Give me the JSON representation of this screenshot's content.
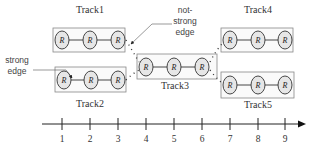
{
  "diagram": {
    "tracks": [
      {
        "label": "Track1",
        "nodes": [
          "R",
          "R",
          "R"
        ],
        "box": [
          53,
          28,
          72,
          24
        ],
        "label_pos": [
          90,
          13
        ],
        "node_y": 40,
        "node_x": [
          62,
          90,
          118
        ]
      },
      {
        "label": "Track2",
        "nodes": [
          "R",
          "R",
          "R"
        ],
        "box": [
          55,
          67,
          71,
          25
        ],
        "label_pos": [
          90,
          107
        ],
        "node_y": 80,
        "node_x": [
          64,
          91,
          118
        ]
      },
      {
        "label": "Track3",
        "nodes": [
          "R",
          "R",
          "R"
        ],
        "box": [
          137,
          54,
          80,
          25
        ],
        "label_pos": [
          175,
          89
        ],
        "node_y": 67,
        "node_x": [
          146,
          174,
          202
        ]
      },
      {
        "label": "Track4",
        "nodes": [
          "R",
          "R",
          "R"
        ],
        "box": [
          221,
          28,
          72,
          24
        ],
        "label_pos": [
          258,
          13
        ],
        "node_y": 40,
        "node_x": [
          230,
          258,
          285
        ]
      },
      {
        "label": "Track5",
        "nodes": [
          "R",
          "R",
          "R"
        ],
        "box": [
          221,
          72,
          73,
          26
        ],
        "label_pos": [
          258,
          108
        ],
        "node_y": 85,
        "node_x": [
          230,
          258,
          285
        ]
      }
    ],
    "annotations": {
      "strong_edge": [
        "strong",
        "edge"
      ],
      "not_strong_edge": [
        "not-",
        "strong",
        "edge"
      ]
    },
    "axis": {
      "ticks": [
        "1",
        "2",
        "3",
        "4",
        "5",
        "6",
        "7",
        "8",
        "9"
      ],
      "tick_x": [
        62,
        90,
        118,
        146,
        174,
        202,
        230,
        258,
        285
      ]
    }
  }
}
